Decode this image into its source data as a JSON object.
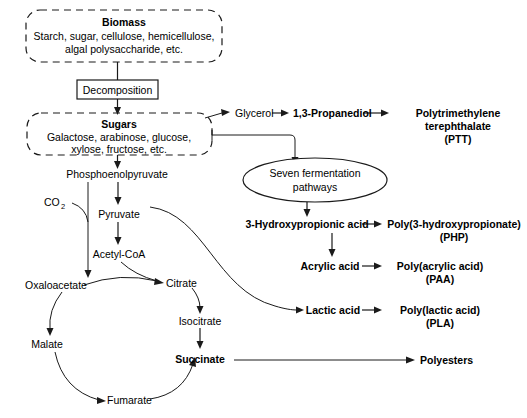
{
  "diagram": {
    "background_color": "#ffffff",
    "line_color": "#1a1a1a",
    "text_color": "#000000"
  },
  "boxes": {
    "biomass": {
      "heading": "Biomass",
      "line1": "Starch, sugar, cellulose, hemicellulose,",
      "line2": "algal polysaccharide, etc.",
      "style": "dashed-rounded"
    },
    "decomposition": {
      "label": "Decomposition",
      "style": "solid-rect"
    },
    "sugars": {
      "heading": "Sugars",
      "line1": "Galactose, arabinose, glucose,",
      "line2": "xylose, fructose, etc.",
      "style": "dashed-rounded"
    },
    "fermentation": {
      "line1": "Seven fermentation",
      "line2": "pathways",
      "style": "ellipse"
    }
  },
  "nodes": {
    "glycerol": "Glycerol",
    "propanediol": "1,3-Propanediol",
    "ptt_line1": "Polytrimethylene",
    "ptt_line2": "terephthalate",
    "ptt_line3": "(PTT)",
    "phosphoenolpyruvate": "Phosphoenolpyruvate",
    "co2": "CO",
    "co2_sub": "2",
    "pyruvate": "Pyruvate",
    "acetyl_coa": "Acetyl-CoA",
    "oxaloacetate": "Oxaloacetate",
    "citrate": "Citrate",
    "isocitrate": "Isocitrate",
    "malate": "Malate",
    "fumarate": "Fumarate",
    "succinate": "Succinate",
    "hydroxypropionic": "3-Hydroxypropionic acid",
    "php_line1": "Poly(3-hydroxypropionate)",
    "php_line2": "(PHP)",
    "acrylic": "Acrylic acid",
    "paa_line1": "Poly(acrylic acid)",
    "paa_line2": "(PAA)",
    "lactic": "Lactic acid",
    "pla_line1": "Poly(lactic acid)",
    "pla_line2": "(PLA)",
    "polyesters": "Polyesters"
  },
  "edges": [
    {
      "from": "biomass",
      "to": "decomposition",
      "kind": "straight-down"
    },
    {
      "from": "decomposition",
      "to": "sugars",
      "kind": "straight-down"
    },
    {
      "from": "sugars",
      "to": "glycerol",
      "kind": "diagonal"
    },
    {
      "from": "glycerol",
      "to": "propanediol",
      "kind": "straight-right"
    },
    {
      "from": "propanediol",
      "to": "ptt",
      "kind": "straight-right"
    },
    {
      "from": "sugars",
      "to": "fermentation",
      "kind": "elbow-right-down"
    },
    {
      "from": "sugars",
      "to": "phosphoenolpyruvate",
      "kind": "straight-down"
    },
    {
      "from": "phosphoenolpyruvate",
      "to": "pyruvate",
      "kind": "straight-down"
    },
    {
      "from": "phosphoenolpyruvate",
      "to": "oxaloacetate",
      "kind": "straight-down"
    },
    {
      "from": "co2",
      "to": "pep-oaa-line",
      "kind": "curve"
    },
    {
      "from": "pyruvate",
      "to": "acetyl_coa",
      "kind": "straight-down"
    },
    {
      "from": "acetyl_coa",
      "to": "citrate",
      "kind": "curve"
    },
    {
      "from": "oxaloacetate",
      "to": "citrate",
      "kind": "curve"
    },
    {
      "from": "citrate",
      "to": "isocitrate",
      "kind": "curve"
    },
    {
      "from": "isocitrate",
      "to": "succinate",
      "kind": "straight-down"
    },
    {
      "from": "oxaloacetate",
      "to": "malate",
      "kind": "curve"
    },
    {
      "from": "malate",
      "to": "fumarate",
      "kind": "curve"
    },
    {
      "from": "fumarate",
      "to": "succinate",
      "kind": "curve"
    },
    {
      "from": "pyruvate",
      "to": "lactic",
      "kind": "long-s-curve"
    },
    {
      "from": "fermentation",
      "to": "hydroxypropionic",
      "kind": "straight-down"
    },
    {
      "from": "hydroxypropionic",
      "to": "php",
      "kind": "straight-right"
    },
    {
      "from": "hydroxypropionic",
      "to": "acrylic",
      "kind": "straight-down"
    },
    {
      "from": "acrylic",
      "to": "paa",
      "kind": "straight-right"
    },
    {
      "from": "lactic",
      "to": "pla",
      "kind": "straight-right"
    },
    {
      "from": "succinate",
      "to": "polyesters",
      "kind": "straight-right"
    }
  ]
}
